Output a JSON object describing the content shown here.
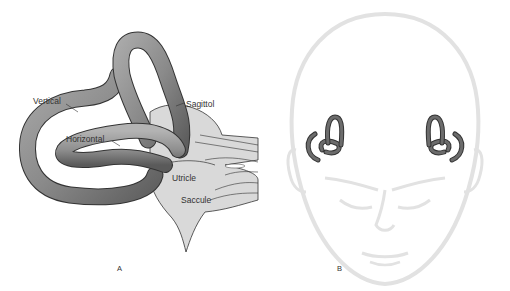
{
  "figure": {
    "panel_a": {
      "letter": "A",
      "labels": {
        "vertical": "Vertical",
        "horizontal": "Horizontal",
        "sagittal": "Sagittol",
        "utricle": "Utricle",
        "saccule": "Saccule"
      }
    },
    "panel_b": {
      "letter": "B"
    }
  },
  "colors": {
    "canal_fill": "#8c8c8c",
    "canal_dark": "#555555",
    "sac_fill": "#d9d9d9",
    "outline": "#333333",
    "face_line": "#e2e2e2",
    "label_text": "#333333"
  }
}
